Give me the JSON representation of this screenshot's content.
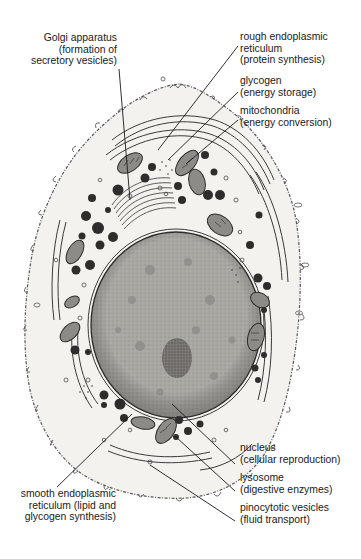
{
  "figure": {
    "colors": {
      "background": "#ffffff",
      "cytoplasm": "#f3f2ef",
      "membrane_outline": "#3a3a3a",
      "nucleus_fill": "#a9a7a2",
      "nucleus_dark": "#7d7b77",
      "nucleolus": "#6b6864",
      "organelle_dark": "#2e2d2b",
      "mitochondria_fill": "#8d8b87",
      "leader_line": "#1a1a1a",
      "text": "#1a1a1a"
    }
  },
  "labels": {
    "golgi": {
      "name": "Golgi apparatus",
      "function_line1": "(formation of",
      "function_line2": "secretory vesicles)"
    },
    "rough_er": {
      "name": "rough endoplasmic",
      "name_line2": "reticulum",
      "function": "(protein synthesis)"
    },
    "glycogen": {
      "name": "glycogen",
      "function": "(energy storage)"
    },
    "mitochondria": {
      "name": "mitochondria",
      "function": "(energy conversion)"
    },
    "nucleus": {
      "name": "nucleus",
      "function": "(cellular reproduction)"
    },
    "lysosome": {
      "name": "lysosome",
      "function": "(digestive enzymes)"
    },
    "pinocytotic": {
      "name": "pinocytotic vesicles",
      "function": "(fluid transport)"
    },
    "smooth_er": {
      "name": "smooth endoplasmic",
      "name_line2": "reticulum (lipid and",
      "function": "glycogen synthesis)"
    }
  }
}
